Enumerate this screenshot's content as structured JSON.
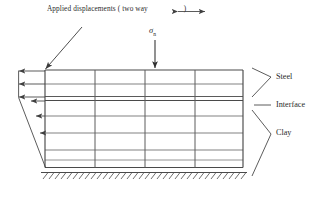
{
  "figure": {
    "type": "finite-element-mesh-diagram",
    "title_top": "Applied displacements ( two way",
    "title_top_close": ")",
    "load_symbol": "σ",
    "load_subscript": "n",
    "labels": {
      "steel": "Steel",
      "interface": "Interface",
      "clay": "Clay"
    },
    "icons": {
      "two_way_arrow": "two-way-arrow-icon",
      "load_arrow": "down-arrow-icon",
      "leader_arrow": "diagonal-leader-arrow-icon",
      "displacement_arrows": "left-arrow-icon",
      "fixed_base": "hatched-ground-icon",
      "bracket_steel": "angle-bracket-icon",
      "bracket_clay": "angle-bracket-icon",
      "dash_interface": "dash-leader-icon"
    },
    "colors": {
      "ink": "#2b2b2b",
      "mesh_line": "#5d5d5d",
      "mesh_line_dark": "#3f3f3f",
      "background": "#ffffff"
    },
    "mesh": {
      "x_left": 45,
      "x_right": 243,
      "y_top": 70,
      "y_bottom": 168,
      "vertical_lines_x": [
        45,
        95,
        145,
        195,
        243
      ],
      "horizontal_lines_y": [
        70,
        84,
        97,
        101,
        116,
        133,
        150,
        160,
        168
      ],
      "columns": 4,
      "rows": 8,
      "layers": [
        {
          "name": "Steel",
          "y_from": 70,
          "y_to": 97
        },
        {
          "name": "Interface",
          "y_from": 97,
          "y_to": 101
        },
        {
          "name": "Clay",
          "y_from": 101,
          "y_to": 168
        }
      ]
    },
    "displacement_arrows": [
      {
        "y": 71,
        "x_tip": 18
      },
      {
        "y": 84,
        "x_tip": 18
      },
      {
        "y": 97,
        "x_tip": 18
      },
      {
        "y": 101,
        "x_tip": 30
      },
      {
        "y": 116,
        "x_tip": 36
      },
      {
        "y": 133,
        "x_tip": 41
      },
      {
        "y": 150,
        "x_tip": 45
      }
    ]
  }
}
